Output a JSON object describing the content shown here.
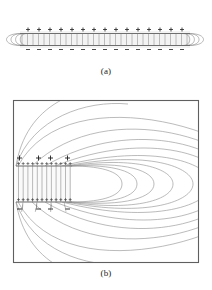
{
  "figure": {
    "kind": "physics-field-line-diagram",
    "background_color": "#ffffff",
    "line_color": "#7a7a7a",
    "dark_line_color": "#4a4a4a",
    "plate_color": "#6e6e6e",
    "slab_fill": "#f2f2f2",
    "border_color": "#5a5a5a"
  },
  "panels": [
    {
      "id": "a",
      "caption": "(a)",
      "description": "Whole parallel-plate capacitor seen edge-on: uniform vertical field lines between the plates and curved fringe field lines looping around both ends.",
      "plate_positive_label": "+",
      "plate_negative_label": "−",
      "positive_charge_count": 15,
      "negative_charge_count": 15,
      "interior_field_line_count": 31,
      "fringe_loops_per_end": 4,
      "geometry": {
        "slab_left": 20,
        "slab_right": 190,
        "top_plate_y": 33,
        "bottom_plate_y": 46
      }
    },
    {
      "id": "b",
      "caption": "(b)",
      "description": "Magnified view of the right-hand edge of the capacitor showing the fringing field: lines leave the positive plate edge, bulge outward into nested arcs, and return to the negative plate edge.",
      "plate_positive_label": "+",
      "plate_negative_label": "−",
      "positive_charge_count": 12,
      "negative_charge_count": 12,
      "marker_row_positive_count": 12,
      "marker_row_negative_count": 12,
      "interior_field_line_count": 12,
      "fringe_arc_count": 10,
      "geometry": {
        "box_left": 13,
        "box_top": 100,
        "box_right": 199,
        "box_bottom": 263,
        "plate_left": 16,
        "plate_right": 71,
        "top_plate_y": 166,
        "bottom_plate_y": 202
      }
    }
  ],
  "axis_note": ""
}
